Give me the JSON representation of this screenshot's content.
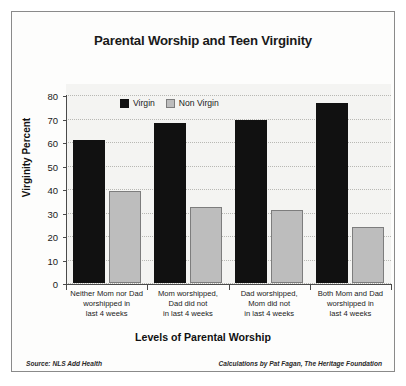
{
  "chart_data": {
    "type": "bar",
    "title": "Parental Worship and Teen Virginity",
    "xlabel": "Levels of Parental Worship",
    "ylabel": "Virginity Percent",
    "ylim": [
      0,
      80
    ],
    "ytick_step": 10,
    "yticks": [
      0,
      10,
      20,
      30,
      40,
      50,
      60,
      70,
      80
    ],
    "grid": true,
    "grid_style": "dotted-horizontal",
    "legend_position": "top-center-inside",
    "categories": [
      "Neither Mom nor Dad worshipped in last 4 weeks",
      "Mom worshipped, Dad did not in last 4 weeks",
      "Dad worshipped, Mom did not in last 4 weeks",
      "Both Mom and Dad worshipped in last 4 weeks"
    ],
    "category_lines": [
      [
        "Neither Mom nor Dad",
        "worshipped in",
        "last 4 weeks"
      ],
      [
        "Mom worshipped,",
        "Dad did not",
        "in last 4 weeks"
      ],
      [
        "Dad worshipped,",
        "Mom did not",
        "in last 4 weeks"
      ],
      [
        "Both Mom and Dad",
        "worshipped in",
        "last 4 weeks"
      ]
    ],
    "series": [
      {
        "name": "Virgin",
        "color": "#111111",
        "values": [
          61,
          68,
          69.5,
          76.5
        ]
      },
      {
        "name": "Non Virgin",
        "color": "#bdbdbd",
        "values": [
          39,
          32.5,
          31,
          24
        ]
      }
    ]
  },
  "footer": {
    "source": "Source: NLS Add Health",
    "credit": "Calculations by Pat Fagan, The Heritage Foundation"
  },
  "colors": {
    "virgin": "#111111",
    "non_virgin": "#bdbdbd",
    "border": "#8a8a8a",
    "plot_bg": "#f4f4f2",
    "axis": "#4a4a4a"
  }
}
